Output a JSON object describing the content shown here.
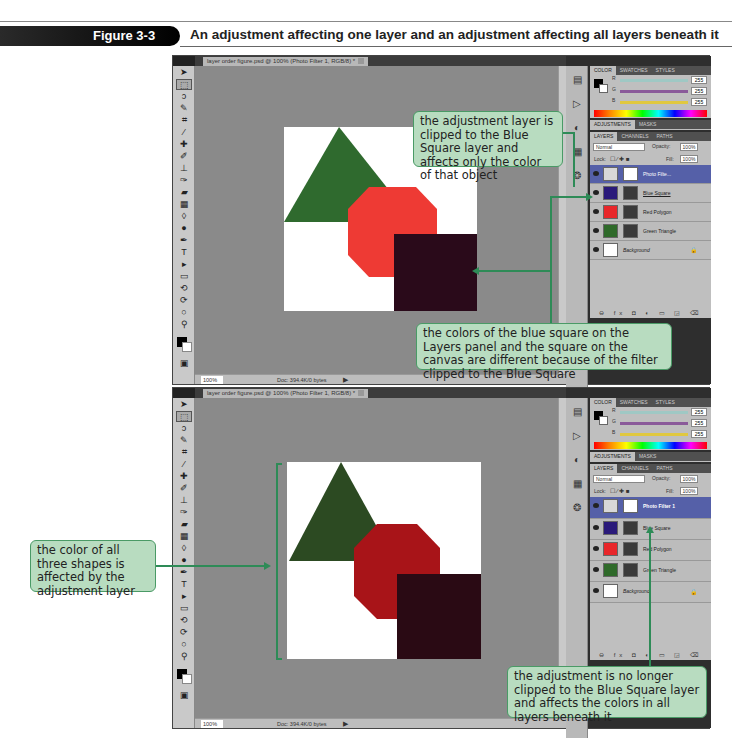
{
  "figure": {
    "label": "Figure 3-3",
    "title": "An adjustment affecting one layer and an adjustment affecting all layers beneath it"
  },
  "windows": [
    {
      "doc_tab": "layer order figure.psd @ 100% (Photo Filter 1, RGB/8) *",
      "status": {
        "zoom": "100%",
        "doc": "Doc: 394.4K/0 bytes"
      },
      "color_panel": {
        "tabs": [
          "COLOR",
          "SWATCHES",
          "STYLES"
        ],
        "r": "255",
        "g": "255",
        "b": "255"
      },
      "adjust_tabs": [
        "ADJUSTMENTS",
        "MASKS"
      ],
      "layers_panel": {
        "tabs": [
          "LAYERS",
          "CHANNELS",
          "PATHS"
        ],
        "blend_mode": "Normal",
        "opacity_label": "Opacity:",
        "opacity": "100%",
        "lock_label": "Lock:",
        "fill_label": "Fill:",
        "fill": "100%",
        "layers": [
          {
            "name": "Photo Filte...",
            "selected": true,
            "thumb": "#d8d8d8"
          },
          {
            "name": "Blue Square",
            "selected": false,
            "thumb": "#2a1a7a"
          },
          {
            "name": "Red Polygon",
            "selected": false,
            "thumb": "#e8262a"
          },
          {
            "name": "Green Triangle",
            "selected": false,
            "thumb": "#2f6a2a"
          },
          {
            "name": "Background",
            "selected": false,
            "thumb": "#ffffff"
          }
        ]
      },
      "canvas_colors": {
        "triangle": "#2f6a2e",
        "polygon": "#ee3a34",
        "square": "#2a0a1a"
      }
    },
    {
      "doc_tab": "layer order figure.psd @ 100% (Photo Filter 1, RGB/8) *",
      "status": {
        "zoom": "100%",
        "doc": "Doc: 394.4K/0 bytes"
      },
      "color_panel": {
        "tabs": [
          "COLOR",
          "SWATCHES",
          "STYLES"
        ],
        "r": "255",
        "g": "255",
        "b": "255"
      },
      "adjust_tabs": [
        "ADJUSTMENTS",
        "MASKS"
      ],
      "layers_panel": {
        "tabs": [
          "LAYERS",
          "CHANNELS",
          "PATHS"
        ],
        "blend_mode": "Normal",
        "opacity_label": "Opacity:",
        "opacity": "100%",
        "lock_label": "Lock:",
        "fill_label": "Fill:",
        "fill": "100%",
        "layers": [
          {
            "name": "Photo Filter 1",
            "selected": true,
            "thumb": "#d8d8d8"
          },
          {
            "name": "Blue Square",
            "selected": false,
            "thumb": "#2a1a7a"
          },
          {
            "name": "Red Polygon",
            "selected": false,
            "thumb": "#e8262a"
          },
          {
            "name": "Green Triangle",
            "selected": false,
            "thumb": "#2f6a2a"
          },
          {
            "name": "Background",
            "selected": false,
            "thumb": "#ffffff"
          }
        ]
      },
      "canvas_colors": {
        "triangle": "#2c4a22",
        "polygon": "#a81418",
        "square": "#2a0a14"
      }
    }
  ],
  "callouts": {
    "clipped": "the adjustment layer is clipped to the Blue Square layer and affects only the color of that object",
    "colors_differ": "the colors of the blue square on the Layers panel and the square on the canvas are different because of the filter clipped to the Blue Square",
    "all_three": "the color of all three shapes is affected by the adjustment layer",
    "not_clipped": "the adjustment is no longer clipped to the Blue Square layer and affects the colors in all layers beneath it"
  },
  "toolbar_icons": [
    "move",
    "marquee",
    "lasso",
    "quick-select",
    "crop",
    "eyedropper",
    "healing",
    "brush",
    "stamp",
    "history-brush",
    "eraser",
    "gradient",
    "blur",
    "dodge",
    "pen",
    "type",
    "path-select",
    "shape",
    "3d-rotate",
    "3d-orbit",
    "hand",
    "zoom"
  ]
}
